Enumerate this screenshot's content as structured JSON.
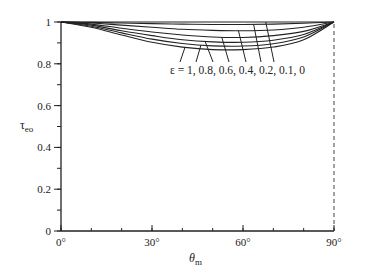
{
  "chart_data": {
    "type": "line",
    "title": "",
    "xlabel": "θm",
    "ylabel": "τeo",
    "xlim": [
      0,
      90
    ],
    "ylim": [
      0,
      1
    ],
    "grid": false,
    "legend_position": "annotation",
    "x_ticks": [
      0,
      30,
      60,
      90
    ],
    "x_tick_labels": [
      "0°",
      "30°",
      "60°",
      "90°"
    ],
    "x_minor_step": 10,
    "y_ticks": [
      0,
      0.2,
      0.4,
      0.6,
      0.8,
      1
    ],
    "y_tick_labels": [
      "0",
      "0.2",
      "0.4",
      "0.6",
      "0.8",
      "1"
    ],
    "y_minor_step": 0.1,
    "annotation": "ε = 1, 0.8, 0.6, 0.4, 0.2, 0.1, 0",
    "x": [
      0,
      10,
      20,
      30,
      40,
      50,
      60,
      70,
      80,
      90
    ],
    "series": [
      {
        "name": "ε = 0",
        "values": [
          1.0,
          1.0,
          1.0,
          1.0,
          1.0,
          1.0,
          1.0,
          1.0,
          1.0,
          1.0
        ]
      },
      {
        "name": "ε = 0.1",
        "values": [
          1.0,
          0.998,
          0.995,
          0.992,
          0.99,
          0.988,
          0.988,
          0.99,
          0.994,
          1.0
        ]
      },
      {
        "name": "ε = 0.2",
        "values": [
          1.0,
          0.995,
          0.985,
          0.975,
          0.965,
          0.96,
          0.958,
          0.962,
          0.975,
          1.0
        ]
      },
      {
        "name": "ε = 0.4",
        "values": [
          1.0,
          0.99,
          0.97,
          0.952,
          0.938,
          0.928,
          0.926,
          0.935,
          0.955,
          1.0
        ]
      },
      {
        "name": "ε = 0.6",
        "values": [
          1.0,
          0.985,
          0.958,
          0.935,
          0.915,
          0.905,
          0.903,
          0.913,
          0.94,
          1.0
        ]
      },
      {
        "name": "ε = 0.8",
        "values": [
          1.0,
          0.98,
          0.948,
          0.918,
          0.897,
          0.886,
          0.885,
          0.896,
          0.928,
          1.0
        ]
      },
      {
        "name": "ε = 1",
        "values": [
          1.0,
          0.975,
          0.938,
          0.903,
          0.88,
          0.868,
          0.868,
          0.88,
          0.915,
          1.0
        ]
      }
    ],
    "reference_line": {
      "x": 90,
      "style": "dashed",
      "from": 0,
      "to": 1
    }
  },
  "labels": {
    "ylabel_main": "τ",
    "ylabel_sub": "eo",
    "xlabel_main": "θ",
    "xlabel_sub": "m",
    "annotation": "ε = 1, 0.8, 0.6, 0.4, 0.2, 0.1, 0"
  }
}
